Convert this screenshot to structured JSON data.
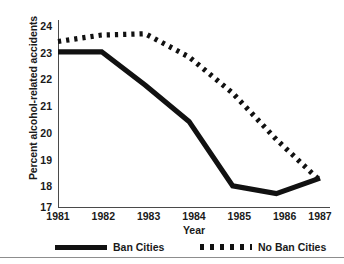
{
  "chart_data": {
    "type": "line",
    "title": "",
    "xlabel": "Year",
    "ylabel": "Percent alcohol-related accidents",
    "x": [
      1981,
      1982,
      1983,
      1984,
      1985,
      1986,
      1987
    ],
    "xticklabels": [
      "1981",
      "1982",
      "1983",
      "1984",
      "1985",
      "1986",
      "1987"
    ],
    "yticklabels": [
      "17",
      "18",
      "19",
      "20",
      "21",
      "22",
      "23",
      "24"
    ],
    "yticks": [
      17,
      18,
      19,
      20,
      21,
      22,
      23,
      24
    ],
    "ylim": [
      17,
      24
    ],
    "xlim": [
      1981,
      1987
    ],
    "grid": false,
    "legend_position": "bottom",
    "series": [
      {
        "name": "Ban Cities",
        "style": "solid",
        "color": "#111111",
        "values": [
          23.0,
          23.0,
          21.7,
          20.3,
          17.8,
          17.5,
          18.1
        ]
      },
      {
        "name": "No Ban Cities",
        "style": "dotted",
        "color": "#111111",
        "values": [
          23.4,
          23.65,
          23.7,
          22.8,
          21.4,
          19.6,
          18.0
        ]
      }
    ]
  },
  "axes": {
    "ylabel": "Percent alcohol-related accidents",
    "xlabel": "Year",
    "yticks": [
      "24",
      "23",
      "22",
      "21",
      "20",
      "19",
      "18",
      "17"
    ],
    "xticks": [
      "1981",
      "1982",
      "1983",
      "1984",
      "1985",
      "1986",
      "1987"
    ]
  },
  "legend": {
    "entries": [
      {
        "label": "Ban Cities",
        "style": "solid"
      },
      {
        "label": "No Ban Cities",
        "style": "dotted"
      }
    ]
  }
}
